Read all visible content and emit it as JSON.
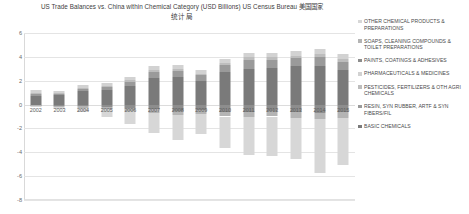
{
  "title": {
    "line1": "US Trade Balances vs. China within Chemical Category (USD Billions) US Census Bureau 美国国家",
    "line2": "统计局"
  },
  "chart_data": {
    "type": "bar",
    "stacked": true,
    "xlabel": "",
    "ylabel": "",
    "ylim": [
      -8,
      6
    ],
    "yticks": [
      6,
      4,
      2,
      0,
      -2,
      -4,
      -6,
      -8
    ],
    "grid": true,
    "legend_position": "right",
    "categories": [
      "2002",
      "2003",
      "2004",
      "2005",
      "2006",
      "2007",
      "2008",
      "2009",
      "2010",
      "2011",
      "2012",
      "2013",
      "2014",
      "2015"
    ],
    "series": [
      {
        "name": "BASIC CHEMICALS",
        "color": "#7a7a7a",
        "values": [
          0.75,
          0.8,
          1.1,
          1.2,
          1.55,
          2.25,
          2.3,
          2.0,
          2.7,
          3.0,
          3.1,
          3.2,
          3.2,
          2.9
        ]
      },
      {
        "name": "RESIN, SYN RUBBER, ARTF & SYN FIBERS/FIL",
        "color": "#9a9a9a",
        "values": [
          0.15,
          0.12,
          0.2,
          0.25,
          0.35,
          0.45,
          0.5,
          0.45,
          0.6,
          0.7,
          0.65,
          0.7,
          0.75,
          0.7
        ]
      },
      {
        "name": "PESTICIDES, FERTILIZERS & OTH AGRI CHEMICALS",
        "color": "#bdbdbd",
        "values": [
          0.1,
          0.08,
          0.1,
          0.12,
          0.15,
          0.2,
          0.2,
          0.15,
          0.2,
          0.25,
          0.2,
          0.2,
          0.25,
          0.2
        ]
      },
      {
        "name": "PHARMACEUTICALS & MEDICINES",
        "color": "#d2d2d2",
        "values": [
          0.2,
          0.15,
          0.2,
          0.25,
          0.3,
          0.35,
          0.35,
          0.3,
          0.35,
          0.4,
          0.35,
          0.4,
          0.45,
          0.4
        ]
      },
      {
        "name": "PAINTS, COATINGS & ADHESIVES",
        "color": "#8d8d8d",
        "values": [
          -0.05,
          -0.1,
          -0.15,
          -0.2,
          -0.3,
          -0.4,
          -0.55,
          -0.45,
          -0.6,
          -0.6,
          -0.55,
          -0.6,
          -0.7,
          -0.65
        ]
      },
      {
        "name": "SOAPS, CLEANING COMPOUNDS & TOILET PREPARATIONS",
        "color": "#b4b4b4",
        "values": [
          -0.05,
          -0.08,
          -0.1,
          -0.15,
          -0.2,
          -0.3,
          -0.35,
          -0.3,
          -0.4,
          -0.45,
          -0.45,
          -0.5,
          -0.55,
          -0.5
        ]
      },
      {
        "name": "OTHER CHEMICAL PRODUCTS & PREPARATIONS",
        "color": "#d7d7d7",
        "values": [
          -0.1,
          -0.2,
          -0.4,
          -0.7,
          -1.1,
          -1.7,
          -2.1,
          -1.7,
          -2.6,
          -3.2,
          -3.3,
          -3.5,
          -4.5,
          -3.9
        ]
      }
    ]
  },
  "legend": {
    "items": [
      {
        "label": "OTHER CHEMICAL PRODUCTS & PREPARATIONS",
        "color": "#d7d7d7"
      },
      {
        "label": "SOAPS, CLEANING COMPOUNDS & TOILET PREPARATIONS",
        "color": "#b4b4b4"
      },
      {
        "label": "PAINTS, COATINGS & ADHESIVES",
        "color": "#8d8d8d"
      },
      {
        "label": "PHARMACEUTICALS & MEDICINES",
        "color": "#d2d2d2"
      },
      {
        "label": "PESTICIDES, FERTILIZERS & OTH AGRI CHEMICALS",
        "color": "#bdbdbd"
      },
      {
        "label": "RESIN, SYN RUBBER, ARTF & SYN FIBERS/FIL",
        "color": "#9a9a9a"
      },
      {
        "label": "BASIC CHEMICALS",
        "color": "#7a7a7a"
      }
    ]
  }
}
